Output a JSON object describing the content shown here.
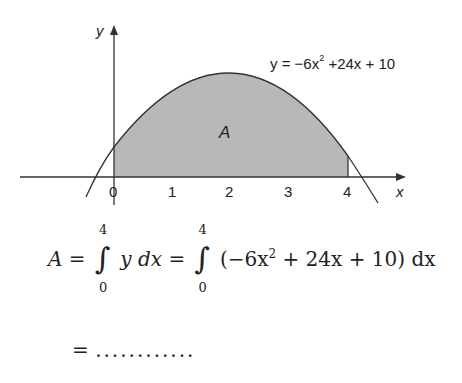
{
  "figure": {
    "y_axis_label": "y",
    "x_axis_label": "x",
    "x_ticks": [
      "0",
      "1",
      "2",
      "3",
      "4"
    ],
    "region_label": "A",
    "curve_label": {
      "prefix": "y = −6x",
      "exponent": "2",
      "suffix": " +24x + 10"
    },
    "shade_color": "#b8b8b8",
    "line_color": "#333333"
  },
  "equation": {
    "lhs": "A",
    "eq1": "=",
    "int1_upper": "4",
    "int1_lower": "0",
    "integrand1": "y dx",
    "eq2": "=",
    "int2_upper": "4",
    "int2_lower": "0",
    "integrand2_a": "(−6x",
    "integrand2_exp": "2",
    "integrand2_b": " + 24x + 10) dx",
    "line2_eq": "=",
    "line2_dots": "............"
  }
}
